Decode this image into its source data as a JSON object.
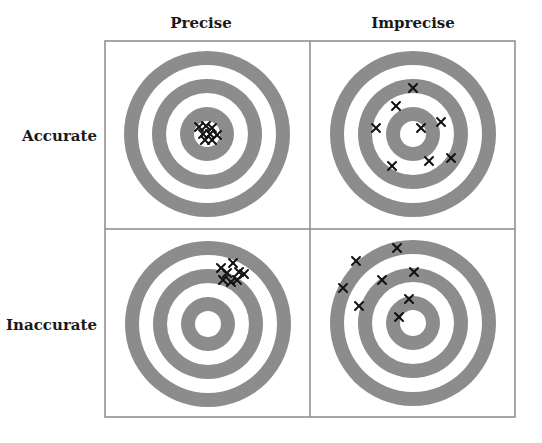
{
  "columns": [
    {
      "label": "Precise",
      "center_x": 201
    },
    {
      "label": "Imprecise",
      "center_x": 413
    }
  ],
  "rows": [
    {
      "label": "Accurate",
      "center_y": 136
    },
    {
      "label": "Inaccurate",
      "center_y": 325
    }
  ],
  "grid": {
    "x": 105,
    "y": 41,
    "width": 410,
    "height": 376,
    "mid_x": 310,
    "mid_y": 229,
    "stroke": "#8a8a8a"
  },
  "colors": {
    "ring": "#8c8c8c",
    "background": "#ffffff",
    "mark": "#111111"
  },
  "ring_radii": [
    83,
    69,
    55,
    41,
    27,
    13
  ],
  "cells": [
    {
      "name": "accurate-precise",
      "center": [
        207,
        134
      ],
      "hits": [
        [
          199,
          127
        ],
        [
          206,
          126
        ],
        [
          212,
          128
        ],
        [
          203,
          134
        ],
        [
          210,
          134
        ],
        [
          217,
          135
        ],
        [
          205,
          140
        ],
        [
          212,
          140
        ]
      ]
    },
    {
      "name": "accurate-imprecise",
      "center": [
        413,
        134
      ],
      "hits": [
        [
          413,
          88
        ],
        [
          396,
          106
        ],
        [
          376,
          128
        ],
        [
          421,
          128
        ],
        [
          441,
          122
        ],
        [
          392,
          166
        ],
        [
          429,
          161
        ],
        [
          451,
          158
        ]
      ]
    },
    {
      "name": "inaccurate-precise",
      "center": [
        208,
        324
      ],
      "hits": [
        [
          221,
          268
        ],
        [
          233,
          263
        ],
        [
          227,
          273
        ],
        [
          239,
          272
        ],
        [
          244,
          274
        ],
        [
          223,
          280
        ],
        [
          231,
          282
        ],
        [
          237,
          280
        ]
      ]
    },
    {
      "name": "inaccurate-imprecise",
      "center": [
        413,
        323
      ],
      "hits": [
        [
          397,
          248
        ],
        [
          356,
          261
        ],
        [
          343,
          288
        ],
        [
          382,
          280
        ],
        [
          414,
          272
        ],
        [
          359,
          306
        ],
        [
          409,
          299
        ],
        [
          399,
          317
        ]
      ]
    }
  ]
}
